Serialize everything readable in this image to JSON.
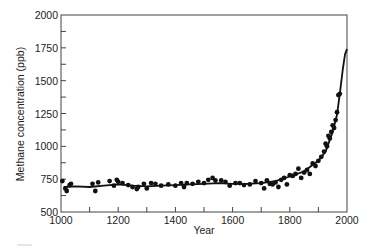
{
  "chart_data": {
    "type": "scatter",
    "title": "",
    "xlabel": "Year",
    "ylabel": "Methane concentration (ppb)",
    "xlim": [
      1000,
      2000
    ],
    "ylim": [
      500,
      2000
    ],
    "xticks": [
      1000,
      1200,
      1400,
      1600,
      1800,
      2000
    ],
    "xminor_step": 100,
    "yticks": [
      500,
      750,
      1000,
      1250,
      1500,
      1750,
      2000
    ],
    "yminor_step": 125,
    "grid": false,
    "legend": null,
    "series": [
      {
        "name": "ice core measurements",
        "kind": "scatter",
        "points": [
          [
            1005,
            735
          ],
          [
            1015,
            680
          ],
          [
            1020,
            660
          ],
          [
            1030,
            705
          ],
          [
            1035,
            715
          ],
          [
            1110,
            715
          ],
          [
            1120,
            660
          ],
          [
            1130,
            725
          ],
          [
            1170,
            735
          ],
          [
            1185,
            700
          ],
          [
            1195,
            745
          ],
          [
            1200,
            730
          ],
          [
            1215,
            720
          ],
          [
            1235,
            705
          ],
          [
            1250,
            690
          ],
          [
            1265,
            675
          ],
          [
            1270,
            690
          ],
          [
            1290,
            715
          ],
          [
            1300,
            680
          ],
          [
            1315,
            720
          ],
          [
            1330,
            715
          ],
          [
            1350,
            700
          ],
          [
            1375,
            710
          ],
          [
            1400,
            700
          ],
          [
            1420,
            720
          ],
          [
            1430,
            690
          ],
          [
            1440,
            720
          ],
          [
            1460,
            715
          ],
          [
            1480,
            730
          ],
          [
            1500,
            720
          ],
          [
            1515,
            745
          ],
          [
            1530,
            760
          ],
          [
            1540,
            740
          ],
          [
            1560,
            740
          ],
          [
            1575,
            730
          ],
          [
            1590,
            700
          ],
          [
            1610,
            720
          ],
          [
            1625,
            720
          ],
          [
            1640,
            705
          ],
          [
            1660,
            710
          ],
          [
            1680,
            735
          ],
          [
            1700,
            720
          ],
          [
            1710,
            680
          ],
          [
            1720,
            740
          ],
          [
            1730,
            715
          ],
          [
            1740,
            710
          ],
          [
            1750,
            725
          ],
          [
            1760,
            690
          ],
          [
            1770,
            745
          ],
          [
            1780,
            760
          ],
          [
            1790,
            710
          ],
          [
            1800,
            780
          ],
          [
            1810,
            775
          ],
          [
            1820,
            790
          ],
          [
            1830,
            830
          ],
          [
            1840,
            760
          ],
          [
            1850,
            800
          ],
          [
            1860,
            820
          ],
          [
            1870,
            790
          ],
          [
            1880,
            870
          ],
          [
            1890,
            850
          ],
          [
            1900,
            890
          ],
          [
            1910,
            920
          ],
          [
            1920,
            960
          ],
          [
            1925,
            1020
          ],
          [
            1930,
            1000
          ],
          [
            1935,
            1080
          ],
          [
            1940,
            1060
          ],
          [
            1945,
            1110
          ],
          [
            1950,
            1160
          ],
          [
            1955,
            1140
          ],
          [
            1960,
            1200
          ],
          [
            1965,
            1260
          ],
          [
            1970,
            1390
          ],
          [
            1975,
            1400
          ]
        ]
      },
      {
        "name": "smoothed trend",
        "kind": "line",
        "points": [
          [
            1010,
            690
          ],
          [
            1050,
            695
          ],
          [
            1100,
            690
          ],
          [
            1150,
            700
          ],
          [
            1200,
            710
          ],
          [
            1250,
            700
          ],
          [
            1300,
            695
          ],
          [
            1350,
            700
          ],
          [
            1400,
            705
          ],
          [
            1450,
            710
          ],
          [
            1500,
            715
          ],
          [
            1550,
            720
          ],
          [
            1600,
            715
          ],
          [
            1650,
            715
          ],
          [
            1700,
            720
          ],
          [
            1750,
            735
          ],
          [
            1800,
            770
          ],
          [
            1850,
            810
          ],
          [
            1900,
            890
          ],
          [
            1925,
            960
          ],
          [
            1950,
            1110
          ],
          [
            1965,
            1240
          ],
          [
            1975,
            1400
          ],
          [
            1985,
            1580
          ],
          [
            1993,
            1700
          ],
          [
            2000,
            1740
          ]
        ]
      }
    ]
  },
  "labels": {
    "xlabel": "Year",
    "ylabel": "Methane concentration (ppb)",
    "xtick_labels": [
      "1000",
      "1200",
      "1400",
      "1600",
      "1800",
      "2000"
    ],
    "ytick_labels": [
      "500",
      "750",
      "1000",
      "1250",
      "1500",
      "1750",
      "2000"
    ]
  }
}
